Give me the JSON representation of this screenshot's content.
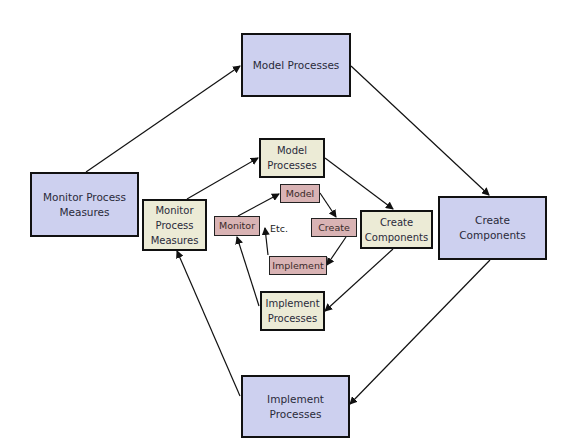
{
  "diagram": {
    "outer": {
      "model": "Model Processes",
      "monitor": "Monitor Process\nMeasures",
      "create": "Create\nComponents",
      "implement": "Implement\nProcesses"
    },
    "middle": {
      "model": "Model\nProcesses",
      "monitor": "Monitor\nProcess\nMeasures",
      "create": "Create\nComponents",
      "implement": "Implement\nProcesses"
    },
    "inner": {
      "model": "Model",
      "monitor": "Monitor",
      "create": "Create",
      "implement": "Implement",
      "etc": "Etc."
    },
    "colors": {
      "outer_fill": "#cdd0ef",
      "middle_fill": "#ecebd6",
      "inner_fill": "#d9b3b4",
      "border": "#111111"
    },
    "edges": [
      {
        "from": "outer.monitor",
        "to": "outer.model"
      },
      {
        "from": "outer.model",
        "to": "outer.create"
      },
      {
        "from": "outer.create",
        "to": "outer.implement"
      },
      {
        "from": "outer.implement",
        "to": "middle.monitor"
      },
      {
        "from": "middle.monitor",
        "to": "middle.model"
      },
      {
        "from": "middle.model",
        "to": "middle.create"
      },
      {
        "from": "middle.create",
        "to": "middle.implement"
      },
      {
        "from": "middle.implement",
        "to": "inner.monitor"
      },
      {
        "from": "inner.monitor",
        "to": "inner.model"
      },
      {
        "from": "inner.model",
        "to": "inner.create"
      },
      {
        "from": "inner.create",
        "to": "inner.implement"
      },
      {
        "from": "inner.implement",
        "to": "etc"
      }
    ]
  }
}
